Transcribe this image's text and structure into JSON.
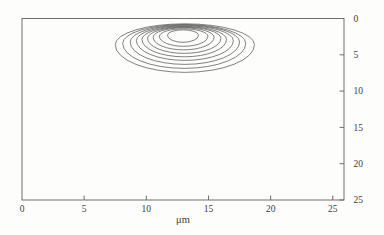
{
  "figure": {
    "background": "#fdfdfb",
    "frame_color": "#606060",
    "contour_color": "#4a4a4a",
    "tick_color": "#606060",
    "label_color": "#3c3c3c",
    "font_size_px": 9.5
  },
  "chart_data": {
    "type": "contour",
    "title": "",
    "xlabel": "μm",
    "ylabel": "",
    "x_range": [
      0,
      25.9
    ],
    "y_range": [
      0,
      25
    ],
    "x_ticks": [
      0,
      5,
      10,
      15,
      20,
      25
    ],
    "y_ticks": [
      0,
      5,
      10,
      15,
      20,
      25
    ],
    "x_tick_labels": [
      "0",
      "5",
      "10",
      "15",
      "20",
      "25"
    ],
    "y_tick_labels": [
      "0",
      "5",
      "10",
      "15",
      "20",
      "25"
    ],
    "y_axis_side": "right",
    "y_direction": "down",
    "grid": false,
    "legend": false,
    "contours": [
      {
        "cx": 12.95,
        "cy": 2.3,
        "rx": 1.25,
        "ry_top": 0.74,
        "ry_bottom": 0.98
      },
      {
        "cx": 13.0,
        "cy": 2.46,
        "rx": 1.95,
        "ry_top": 1.04,
        "ry_bottom": 1.37
      },
      {
        "cx": 13.0,
        "cy": 2.59,
        "rx": 2.45,
        "ry_top": 1.31,
        "ry_bottom": 1.73
      },
      {
        "cx": 13.05,
        "cy": 2.74,
        "rx": 2.95,
        "ry_top": 1.55,
        "ry_bottom": 2.06
      },
      {
        "cx": 13.05,
        "cy": 2.9,
        "rx": 3.4,
        "ry_top": 1.8,
        "ry_bottom": 2.38
      },
      {
        "cx": 13.1,
        "cy": 3.05,
        "rx": 3.9,
        "ry_top": 2.05,
        "ry_bottom": 2.72
      },
      {
        "cx": 13.1,
        "cy": 3.24,
        "rx": 4.4,
        "ry_top": 2.33,
        "ry_bottom": 3.08
      },
      {
        "cx": 13.05,
        "cy": 3.43,
        "rx": 4.95,
        "ry_top": 2.6,
        "ry_bottom": 3.44
      },
      {
        "cx": 13.1,
        "cy": 3.61,
        "rx": 5.6,
        "ry_top": 2.88,
        "ry_bottom": 3.81
      }
    ]
  },
  "plot_geometry_px": {
    "frame_left": 22,
    "frame_top": 18.5,
    "frame_right": 344,
    "frame_bottom": 200,
    "tick_len": 4.5,
    "x_label_baseline_y": 211.5,
    "xlabel_baseline_y": 223,
    "y_label_offset_x": 9.5
  }
}
